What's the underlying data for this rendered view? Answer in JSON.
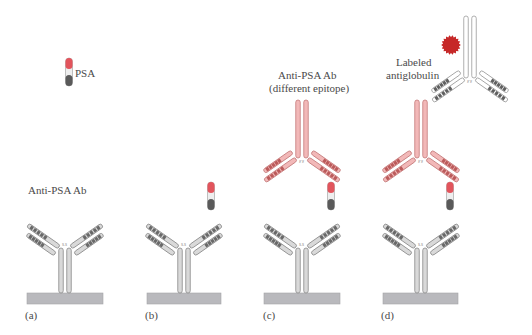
{
  "figure": {
    "panels": [
      {
        "id": "a",
        "label": "(a)",
        "caption": "Anti-PSA Ab"
      },
      {
        "id": "b",
        "label": "(b)",
        "caption": ""
      },
      {
        "id": "c",
        "label": "(c)",
        "caption_line1": "Anti-PSA Ab",
        "caption_line2": "(different epitope)"
      },
      {
        "id": "d",
        "label": "(d)",
        "caption_line1": "Labeled",
        "caption_line2": "antiglobulin"
      }
    ],
    "legend": {
      "psa_label": "PSA"
    },
    "colors": {
      "capture_antibody": "#d9d9d9",
      "detection_antibody": "#f2b8b8",
      "antiglobulin": "#ffffff",
      "psa_top": "#e2545c",
      "psa_bottom": "#5a5a5a",
      "label_dot": "#c62828",
      "plate": "#b9b9bd"
    }
  }
}
